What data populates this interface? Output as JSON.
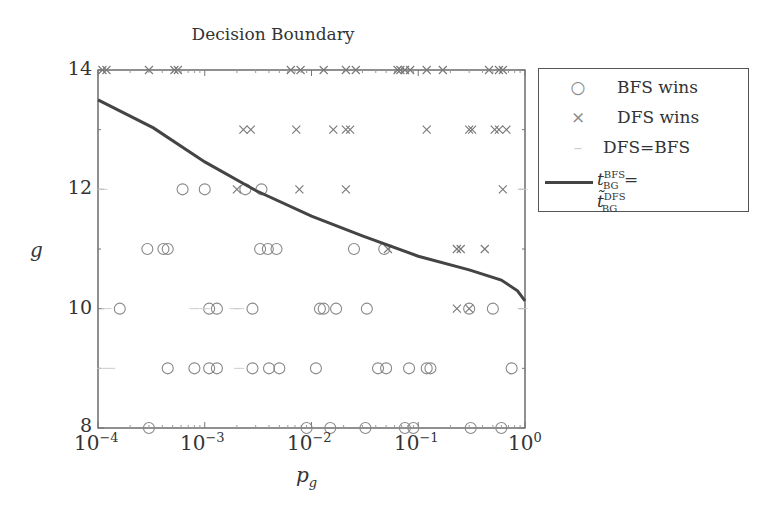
{
  "chart_data": {
    "type": "scatter",
    "title": "Decision Boundary",
    "xlabel": "p_g",
    "ylabel": "g",
    "xscale": "log",
    "xlim": [
      0.0001,
      1
    ],
    "ylim": [
      8,
      14
    ],
    "x_ticks": [
      "10^-4",
      "10^-3",
      "10^-2",
      "10^-1",
      "10^0"
    ],
    "y_ticks": [
      "8",
      "10",
      "12",
      "14"
    ],
    "grid": false,
    "legend_position": "outside right, top",
    "legend": [
      "BFS wins",
      "DFS wins",
      "DFS=BFS",
      "t_BG^BFS = t~_BG^DFS"
    ],
    "series": [
      {
        "name": "BFS wins",
        "marker": "circle",
        "points": [
          [
            0.0003,
            8
          ],
          [
            0.009,
            8
          ],
          [
            0.015,
            8
          ],
          [
            0.032,
            8
          ],
          [
            0.075,
            8
          ],
          [
            0.09,
            8
          ],
          [
            0.31,
            8
          ],
          [
            0.6,
            8
          ],
          [
            0.00045,
            9
          ],
          [
            0.0008,
            9
          ],
          [
            0.0011,
            9
          ],
          [
            0.0013,
            9
          ],
          [
            0.0028,
            9
          ],
          [
            0.004,
            9
          ],
          [
            0.005,
            9
          ],
          [
            0.011,
            9
          ],
          [
            0.042,
            9
          ],
          [
            0.05,
            9
          ],
          [
            0.082,
            9
          ],
          [
            0.12,
            9
          ],
          [
            0.13,
            9
          ],
          [
            0.75,
            9
          ],
          [
            0.00016,
            10
          ],
          [
            0.0011,
            10
          ],
          [
            0.0013,
            10
          ],
          [
            0.0028,
            10
          ],
          [
            0.012,
            10
          ],
          [
            0.013,
            10
          ],
          [
            0.017,
            10
          ],
          [
            0.033,
            10
          ],
          [
            0.3,
            10
          ],
          [
            0.5,
            10
          ],
          [
            0.00029,
            11
          ],
          [
            0.00041,
            11
          ],
          [
            0.00045,
            11
          ],
          [
            0.0033,
            11
          ],
          [
            0.0039,
            11
          ],
          [
            0.0047,
            11
          ],
          [
            0.025,
            11
          ],
          [
            0.048,
            11
          ],
          [
            0.00062,
            12
          ],
          [
            0.001,
            12
          ],
          [
            0.0024,
            12
          ],
          [
            0.0034,
            12
          ]
        ]
      },
      {
        "name": "DFS wins",
        "marker": "x",
        "points": [
          [
            0.00011,
            14
          ],
          [
            0.00012,
            14
          ],
          [
            0.0003,
            14
          ],
          [
            0.00052,
            14
          ],
          [
            0.00056,
            14
          ],
          [
            0.0064,
            14
          ],
          [
            0.0079,
            14
          ],
          [
            0.013,
            14
          ],
          [
            0.021,
            14
          ],
          [
            0.026,
            14
          ],
          [
            0.064,
            14
          ],
          [
            0.068,
            14
          ],
          [
            0.075,
            14
          ],
          [
            0.084,
            14
          ],
          [
            0.12,
            14
          ],
          [
            0.17,
            14
          ],
          [
            0.46,
            14
          ],
          [
            0.57,
            14
          ],
          [
            0.62,
            14
          ],
          [
            0.0023,
            13
          ],
          [
            0.0027,
            13
          ],
          [
            0.0072,
            13
          ],
          [
            0.016,
            13
          ],
          [
            0.021,
            13
          ],
          [
            0.023,
            13
          ],
          [
            0.12,
            13
          ],
          [
            0.3,
            13
          ],
          [
            0.32,
            13
          ],
          [
            0.52,
            13
          ],
          [
            0.57,
            13
          ],
          [
            0.67,
            13
          ],
          [
            0.002,
            12
          ],
          [
            0.0077,
            12
          ],
          [
            0.021,
            12
          ],
          [
            0.62,
            12
          ],
          [
            0.052,
            11
          ],
          [
            0.23,
            11
          ],
          [
            0.25,
            11
          ],
          [
            0.42,
            11
          ],
          [
            0.23,
            10
          ],
          [
            0.3,
            10
          ]
        ]
      },
      {
        "name": "DFS=BFS",
        "marker": "dash",
        "points": [
          [
            0.00011,
            12
          ],
          [
            0.00012,
            10
          ],
          [
            0.00011,
            9
          ],
          [
            0.00013,
            9
          ],
          [
            0.0008,
            10
          ],
          [
            0.001,
            10
          ],
          [
            0.0019,
            10
          ],
          [
            0.0021,
            10
          ],
          [
            0.0021,
            9
          ],
          [
            0.95,
            12
          ],
          [
            0.95,
            10
          ]
        ]
      },
      {
        "name": "t_BG^BFS = t~_BG^DFS",
        "type": "line",
        "points": [
          [
            0.0001,
            13.5
          ],
          [
            0.00033,
            13.03
          ],
          [
            0.001,
            12.46
          ],
          [
            0.003,
            11.98
          ],
          [
            0.01,
            11.55
          ],
          [
            0.03,
            11.22
          ],
          [
            0.1,
            10.88
          ],
          [
            0.3,
            10.65
          ],
          [
            0.6,
            10.48
          ],
          [
            0.85,
            10.3
          ],
          [
            1.0,
            10.13
          ]
        ]
      }
    ]
  },
  "title": "Decision Boundary",
  "xlabel": "p",
  "xlabel_sub": "g",
  "ylabel": "g",
  "yticks": [
    "14",
    "12",
    "10",
    "8"
  ],
  "xticks": [
    {
      "base": "10",
      "exp": "−4"
    },
    {
      "base": "10",
      "exp": "−3"
    },
    {
      "base": "10",
      "exp": "−2"
    },
    {
      "base": "10",
      "exp": "−1"
    },
    {
      "base": "10",
      "exp": "0"
    }
  ],
  "legend": {
    "bfs": "BFS wins",
    "dfs": "DFS wins",
    "eq": "DFS=BFS",
    "line_t": "t",
    "line_sup": "BFS",
    "line_sub": "BG",
    "line_eq": " = ",
    "line_t2": "t̃",
    "line_sup2": "DFS",
    "line_sub2": "BG",
    "sym_circle": "○",
    "sym_x": "×",
    "sym_dash": "–"
  }
}
